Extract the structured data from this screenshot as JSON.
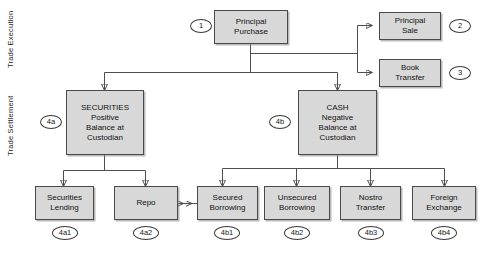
{
  "diagram": {
    "type": "flowchart",
    "swimlanes": [
      {
        "id": "lane-trade-execution",
        "label": "Trade\nExecution"
      },
      {
        "id": "lane-trade-settlement",
        "label": "Trade\nSettlement"
      }
    ],
    "nodes": [
      {
        "id": "principal-purchase",
        "lines": [
          "Principal",
          "Purchase"
        ],
        "marker": "1"
      },
      {
        "id": "principal-sale",
        "lines": [
          "Principal",
          "Sale"
        ],
        "marker": "2"
      },
      {
        "id": "book-transfer",
        "lines": [
          "Book",
          "Transfer"
        ],
        "marker": "3"
      },
      {
        "id": "securities-balance",
        "lines": [
          "SECURITIES",
          "Positive",
          "Balance at",
          "Custodian"
        ],
        "marker": "4a"
      },
      {
        "id": "cash-balance",
        "lines": [
          "CASH",
          "Negative",
          "Balance at",
          "Custodian"
        ],
        "marker": "4b"
      },
      {
        "id": "securities-lending",
        "lines": [
          "Securities",
          "Lending"
        ],
        "marker": "4a1"
      },
      {
        "id": "repo",
        "lines": [
          "Repo"
        ],
        "marker": "4a2"
      },
      {
        "id": "secured-borrowing",
        "lines": [
          "Secured",
          "Borrowing"
        ],
        "marker": "4b1"
      },
      {
        "id": "unsecured-borrowing",
        "lines": [
          "Unsecured",
          "Borrowing"
        ],
        "marker": "4b2"
      },
      {
        "id": "nostro-transfer",
        "lines": [
          "Nostro",
          "Transfer"
        ],
        "marker": "4b3"
      },
      {
        "id": "foreign-exchange",
        "lines": [
          "Foreign",
          "Exchange"
        ],
        "marker": "4b4"
      }
    ],
    "colors": {
      "node_fill": "#d8d8d8",
      "node_border": "#4a4a4a",
      "connector": "#4f4f4f",
      "marker_fill": "#ffffff",
      "background": "#ffffff"
    }
  }
}
